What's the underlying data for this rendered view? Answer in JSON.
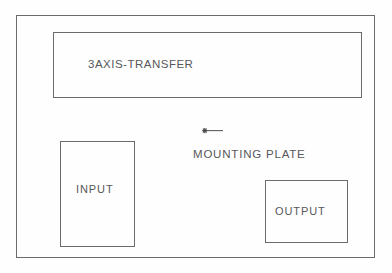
{
  "diagram": {
    "background_color": "#fefefe",
    "line_color": "#6b6b6b",
    "text_color": "#57585a",
    "outer_frame": {
      "name": "machine-cell-outline",
      "x": 16,
      "y": 15,
      "width": 359,
      "height": 243
    },
    "blocks": [
      {
        "id": "transfer",
        "label": "3AXIS-TRANSFER",
        "x": 53,
        "y": 32,
        "width": 309,
        "height": 66
      },
      {
        "id": "input",
        "label": "INPUT",
        "x": 60,
        "y": 141,
        "width": 75,
        "height": 106
      },
      {
        "id": "output",
        "label": "OUTPUT",
        "x": 265,
        "y": 180,
        "width": 83,
        "height": 63
      }
    ],
    "annotations": [
      {
        "id": "mounting-plate",
        "label": "MOUNTING PLATE",
        "marker": "asterisk-with-leader-line",
        "marker_glyph": "*",
        "marker_x": 198,
        "marker_y": 124,
        "label_x": 193,
        "label_y": 149
      }
    ]
  }
}
